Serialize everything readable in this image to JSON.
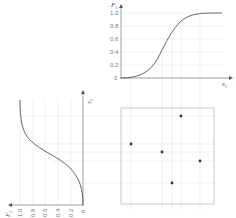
{
  "top_plot": {
    "y_label": "F",
    "y_label_sub": "1",
    "x_label": "x",
    "x_label_sub": "1",
    "y_ticks": [
      "1.0",
      "0.8",
      "0.6",
      "0.4",
      "0.2",
      "0"
    ]
  },
  "left_plot": {
    "y_label": "x",
    "y_label_sub": "2",
    "x_label": "F",
    "x_label_sub": "2",
    "x_ticks": [
      "1.0",
      "0.8",
      "0.6",
      "0.4",
      "0.2",
      "0"
    ]
  },
  "scatter": {
    "points": [
      {
        "x": 131,
        "y": 144
      },
      {
        "x": 181,
        "y": 116
      },
      {
        "x": 162,
        "y": 152
      },
      {
        "x": 200,
        "y": 161
      },
      {
        "x": 172,
        "y": 183
      }
    ]
  },
  "colors": {
    "axis": "#888888",
    "curve": "#555555",
    "grid": "#e4e4e4",
    "point": "#333333"
  }
}
